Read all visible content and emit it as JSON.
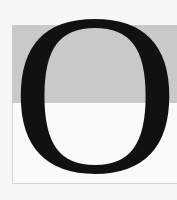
{
  "drop_cap": {
    "letter": "O",
    "shade_color": "#c9c9c9",
    "box_color": "#fafafa",
    "ink_color": "#111111"
  }
}
